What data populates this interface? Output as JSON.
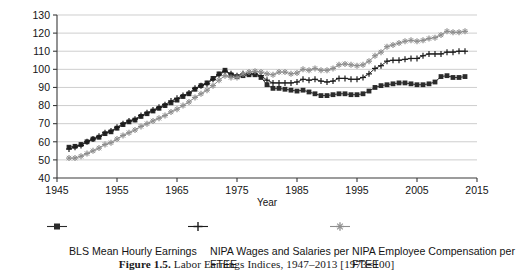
{
  "figure": {
    "caption_label": "Figure 1.5.",
    "caption_text": " Labor Earnings Indices, 1947–2013 [1973=100]"
  },
  "legend": {
    "items": [
      {
        "label": "BLS Mean Hourly Earnings",
        "marker": "filled-square-marker",
        "color": "#2b2b2b"
      },
      {
        "label": "NIPA Wages and Salaries per FTEE",
        "marker": "plus-marker",
        "color": "#1c1c1c"
      },
      {
        "label": "NIPA Employee Compensation per FTEE",
        "marker": "star-marker",
        "color": "#8e8e8e"
      }
    ]
  },
  "chart_data": {
    "type": "line",
    "title": "Labor Earnings Indices, 1947–2013 [1973=100]",
    "xlabel": "Year",
    "ylabel": "",
    "xlim": [
      1945,
      2015
    ],
    "ylim": [
      40,
      130
    ],
    "xticks": [
      1945,
      1955,
      1965,
      1975,
      1985,
      1995,
      2005,
      2015
    ],
    "yticks": [
      40,
      50,
      60,
      70,
      80,
      90,
      100,
      110,
      120,
      130
    ],
    "grid": true,
    "legend_position": "below",
    "x": [
      1947,
      1948,
      1949,
      1950,
      1951,
      1952,
      1953,
      1954,
      1955,
      1956,
      1957,
      1958,
      1959,
      1960,
      1961,
      1962,
      1963,
      1964,
      1965,
      1966,
      1967,
      1968,
      1969,
      1970,
      1971,
      1972,
      1973,
      1974,
      1975,
      1976,
      1977,
      1978,
      1979,
      1980,
      1981,
      1982,
      1983,
      1984,
      1985,
      1986,
      1987,
      1988,
      1989,
      1990,
      1991,
      1992,
      1993,
      1994,
      1995,
      1996,
      1997,
      1998,
      1999,
      2000,
      2001,
      2002,
      2003,
      2004,
      2005,
      2006,
      2007,
      2008,
      2009,
      2010,
      2011,
      2012,
      2013
    ],
    "series": [
      {
        "name": "BLS Mean Hourly Earnings",
        "marker": "filled-square-marker",
        "color": "#2b2b2b",
        "values": [
          57.0,
          57.5,
          58.5,
          60.0,
          61.5,
          62.5,
          64.5,
          65.5,
          67.5,
          69.5,
          71.0,
          72.0,
          74.0,
          75.5,
          77.0,
          78.5,
          80.0,
          81.5,
          83.0,
          85.0,
          86.5,
          89.0,
          91.0,
          92.5,
          95.0,
          97.5,
          99.5,
          97.0,
          96.0,
          96.5,
          97.0,
          97.0,
          95.5,
          91.5,
          89.5,
          89.5,
          89.0,
          88.5,
          88.0,
          88.5,
          87.5,
          86.5,
          85.5,
          85.5,
          86.0,
          86.5,
          86.5,
          86.0,
          86.0,
          86.5,
          88.0,
          90.0,
          91.0,
          91.5,
          92.0,
          92.5,
          92.5,
          92.0,
          91.5,
          91.5,
          92.0,
          93.0,
          96.0,
          96.5,
          95.5,
          95.5,
          96.0
        ]
      },
      {
        "name": "NIPA Wages and Salaries per FTEE",
        "marker": "plus-marker",
        "color": "#1c1c1c",
        "values": [
          56.0,
          57.0,
          58.0,
          60.0,
          61.5,
          63.0,
          65.0,
          66.0,
          68.0,
          70.0,
          71.5,
          72.5,
          74.5,
          76.0,
          77.5,
          79.0,
          80.5,
          82.5,
          84.0,
          85.5,
          87.0,
          89.5,
          91.0,
          92.0,
          94.5,
          97.0,
          99.0,
          97.5,
          96.5,
          97.5,
          97.5,
          97.5,
          96.5,
          94.0,
          92.5,
          92.5,
          92.5,
          92.5,
          93.0,
          94.5,
          94.0,
          94.5,
          93.5,
          93.0,
          93.5,
          95.0,
          95.0,
          94.5,
          94.5,
          95.5,
          97.5,
          100.5,
          102.0,
          104.5,
          105.0,
          105.0,
          105.5,
          106.0,
          106.0,
          107.5,
          108.5,
          108.5,
          108.5,
          109.5,
          109.5,
          110.0,
          110.0
        ]
      },
      {
        "name": "NIPA Employee Compensation per FTEE",
        "marker": "star-marker",
        "color": "#8e8e8e",
        "values": [
          51.0,
          51.0,
          52.0,
          53.5,
          55.0,
          56.5,
          58.5,
          59.5,
          61.5,
          63.5,
          65.0,
          66.5,
          68.5,
          70.0,
          71.5,
          73.0,
          74.5,
          76.5,
          78.0,
          80.0,
          82.0,
          84.5,
          86.5,
          88.5,
          91.0,
          94.0,
          96.5,
          95.5,
          95.5,
          97.5,
          98.5,
          99.0,
          98.5,
          97.5,
          97.0,
          98.5,
          98.5,
          97.5,
          98.0,
          100.0,
          99.5,
          100.5,
          99.5,
          99.5,
          100.5,
          102.5,
          103.0,
          102.5,
          102.0,
          102.5,
          104.5,
          107.5,
          109.5,
          112.5,
          113.5,
          114.5,
          115.5,
          116.0,
          115.5,
          116.0,
          117.0,
          117.5,
          119.0,
          121.0,
          120.5,
          120.5,
          121.0
        ]
      }
    ]
  }
}
